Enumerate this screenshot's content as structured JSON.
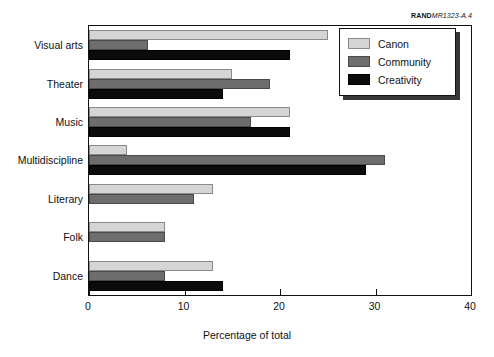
{
  "source_label": {
    "brand": "RAND",
    "code": "MR1323-A.4"
  },
  "chart_data": {
    "type": "bar",
    "orientation": "horizontal",
    "title": "",
    "xlabel": "Percentage of total",
    "ylabel": "",
    "xlim": [
      0,
      40
    ],
    "xticks": [
      0,
      10,
      20,
      30,
      40
    ],
    "xtick_labels": [
      "0",
      "10",
      "20",
      "30",
      "40"
    ],
    "grid": false,
    "legend_position": "lower-right-inside",
    "categories": [
      "Visual arts",
      "Theater",
      "Music",
      "Multidiscipline",
      "Literary",
      "Folk",
      "Dance"
    ],
    "series": [
      {
        "name": "Canon",
        "color": "#d5d5d5",
        "values": [
          25,
          15,
          21,
          4,
          13,
          8,
          13
        ]
      },
      {
        "name": "Community",
        "color": "#6d6d6d",
        "values": [
          6.2,
          19,
          17,
          31,
          11,
          8,
          8
        ]
      },
      {
        "name": "Creativity",
        "color": "#0b0b0b",
        "values": [
          21,
          14,
          21,
          29,
          0,
          0,
          14
        ]
      }
    ]
  }
}
